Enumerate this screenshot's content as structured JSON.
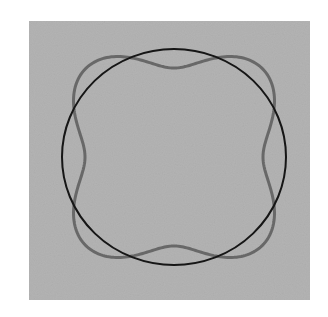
{
  "figure": {
    "background": "#ffffff",
    "panel": {
      "x": 29,
      "y": 21,
      "width": 281,
      "height": 279,
      "color": "#b4b4b4"
    },
    "center": {
      "x": 174,
      "y": 157
    },
    "reference_circle": {
      "rx": 112,
      "ry": 108,
      "stroke": "#161616",
      "stroke_width": 2
    },
    "perturbed_curve": {
      "base_radius": 107,
      "amplitude": 18,
      "mode": 4,
      "stroke": "#686868",
      "stroke_width": 3
    }
  }
}
